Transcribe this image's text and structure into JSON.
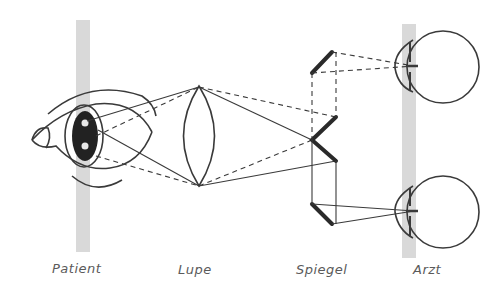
{
  "diagram": {
    "colors": {
      "line": "#3a3a3a",
      "mirror": "#2a2a2a",
      "plane_bar": "#d9d9d9",
      "pupil": "#222222",
      "label": "#5a5a5a"
    },
    "labels": {
      "patient": "Patient",
      "lupe": "Lupe",
      "spiegel": "Spiegel",
      "arzt": "Arzt"
    },
    "components": [
      {
        "id": "patient-eye",
        "label": "Patient"
      },
      {
        "id": "lens",
        "label": "Lupe"
      },
      {
        "id": "mirror-system",
        "label": "Spiegel"
      },
      {
        "id": "observer-eyes",
        "label": "Arzt"
      }
    ]
  }
}
